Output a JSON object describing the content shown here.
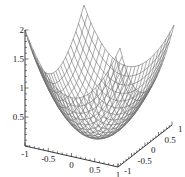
{
  "chart_data": {
    "type": "surface3d",
    "title": "",
    "function": "z = x^2 + y^2",
    "x_range": [
      -1,
      1
    ],
    "y_range": [
      -1,
      1
    ],
    "z_range": [
      0,
      2
    ],
    "grid_lines": 25,
    "colors": {
      "mesh": "#6e6e6e",
      "axis": "#222222",
      "fill": "#ffffff"
    },
    "axes": {
      "x": {
        "label": "",
        "ticks": [
          "-1",
          "-0.5",
          "0",
          "0.5",
          "1"
        ],
        "tick_values": [
          -1,
          -0.5,
          0,
          0.5,
          1
        ]
      },
      "y": {
        "label": "",
        "ticks": [
          "-1",
          "-0.5",
          "0",
          "0.5",
          "1"
        ],
        "tick_values": [
          -1,
          -0.5,
          0,
          0.5,
          1
        ]
      },
      "z": {
        "label": "",
        "ticks": [
          "0.5",
          "1",
          "1.5",
          "2"
        ],
        "tick_values": [
          0.5,
          1,
          1.5,
          2
        ]
      }
    }
  }
}
